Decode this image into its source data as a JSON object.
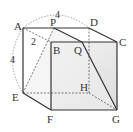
{
  "diagram": {
    "type": "cube-section",
    "vertices": {
      "A": "A",
      "B": "B",
      "C": "C",
      "D": "D",
      "E": "E",
      "F": "F",
      "G": "G",
      "H": "H",
      "P": "P",
      "Q": "Q"
    },
    "measures": {
      "top_arc": "4",
      "ap_len": "2",
      "side_arc": "4"
    },
    "colors": {
      "edge": "#333333",
      "hidden": "#555555",
      "face_shade": "#e8e8e8",
      "arc": "#888888"
    }
  }
}
